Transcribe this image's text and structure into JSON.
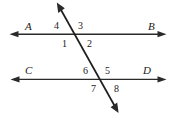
{
  "figure": {
    "kind": "parallel-lines-cut-by-transversal",
    "background_color": "#ffffff",
    "line_color": "#2a2a2a",
    "label_color": "#1a1a1a",
    "width": 173,
    "height": 117,
    "line_labels": {
      "top_left": "A",
      "top_right": "B",
      "bottom_left": "C",
      "bottom_right": "D"
    },
    "angle_labels": {
      "top_upper_left": "4",
      "top_upper_right": "3",
      "top_lower_left": "1",
      "top_lower_right": "2",
      "bottom_upper_left": "6",
      "bottom_upper_right": "5",
      "bottom_lower_left": "7",
      "bottom_lower_right": "8"
    }
  }
}
